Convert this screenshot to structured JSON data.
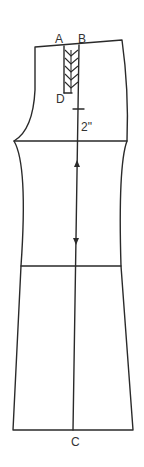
{
  "diagram": {
    "type": "pattern-draft",
    "labels": {
      "point_a": "A",
      "point_b": "B",
      "point_d": "D",
      "point_c": "C",
      "measurement": "2\""
    },
    "colors": {
      "line": "#2a2a2a",
      "background": "#ffffff"
    }
  }
}
